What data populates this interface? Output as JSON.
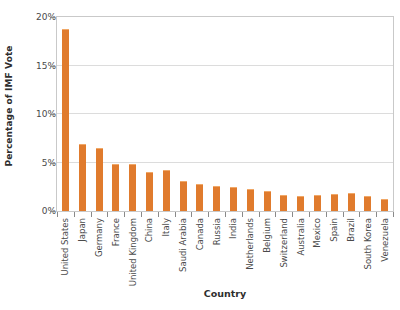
{
  "chart_data": {
    "type": "bar",
    "title": "",
    "subtitle": "",
    "xlabel": "Country",
    "ylabel": "Percentage of IMF Vote",
    "ylim": [
      0,
      20
    ],
    "yticks": [
      0,
      5,
      10,
      15,
      20
    ],
    "ytick_labels": [
      "0%",
      "5%",
      "10%",
      "15%",
      "20%"
    ],
    "grid": "horizontal",
    "legend": null,
    "bar_color": "#e07b2d",
    "bar_edge_color": "#f0a868",
    "gridline_color": "#dcdcdc",
    "plot_border_color": "#c9c9c9",
    "axis_text_color": "#4a4a4a",
    "categories": [
      "United States",
      "Japan",
      "Germany",
      "France",
      "United Kingdom",
      "China",
      "Italy",
      "Saudi Arabia",
      "Canada",
      "Russia",
      "India",
      "Netherlands",
      "Belgium",
      "Switzerland",
      "Australia",
      "Mexico",
      "Spain",
      "Brazil",
      "South Korea",
      "Venezuela"
    ],
    "values": [
      18.8,
      6.9,
      6.5,
      4.8,
      4.8,
      4.0,
      4.2,
      3.1,
      2.8,
      2.6,
      2.5,
      2.3,
      2.1,
      1.6,
      1.5,
      1.7,
      1.8,
      1.9,
      1.5,
      1.2
    ]
  }
}
